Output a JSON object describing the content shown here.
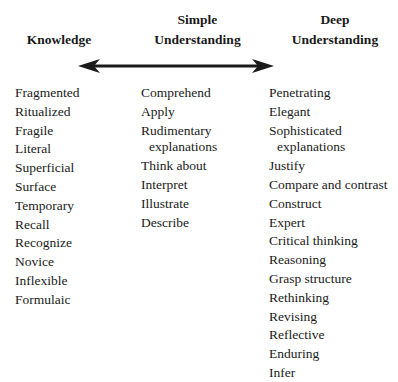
{
  "headers": {
    "knowledge": "Knowledge",
    "simple_line1": "Simple",
    "simple_line2": "Understanding",
    "deep_line1": "Deep",
    "deep_line2": "Understanding"
  },
  "arrow": {
    "type": "double-headed",
    "color": "#1a1a1a"
  },
  "columns": {
    "knowledge": [
      "Fragmented",
      "Ritualized",
      "Fragile",
      "Literal",
      "Superficial",
      "Surface",
      "Temporary",
      "Recall",
      "Recognize",
      "Novice",
      "Inflexible",
      "Formulaic"
    ],
    "simple": [
      "Comprehend",
      "Apply",
      "Rudimentary",
      "explanations",
      "Think about",
      "Interpret",
      "Illustrate",
      "Describe"
    ],
    "deep": [
      "Penetrating",
      "Elegant",
      "Sophisticated",
      "explanations",
      "Justify",
      "Compare and contrast",
      "Construct",
      "Expert",
      "Critical thinking",
      "Reasoning",
      "Grasp structure",
      "Rethinking",
      "Revising",
      "Reflective",
      "Enduring",
      "Infer"
    ]
  }
}
